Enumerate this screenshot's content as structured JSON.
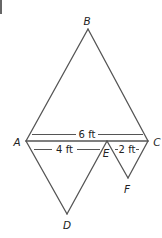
{
  "figure": {
    "points": {
      "A": {
        "label": "A"
      },
      "B": {
        "label": "B"
      },
      "C": {
        "label": "C"
      },
      "D": {
        "label": "D"
      },
      "E": {
        "label": "E"
      },
      "F": {
        "label": "F"
      }
    },
    "dimensions": {
      "AC": "6 ft",
      "AE": "4 ft",
      "EC": "2 ft"
    },
    "colors": {
      "stroke": "#555555",
      "text": "#222222",
      "background": "#ffffff"
    }
  }
}
